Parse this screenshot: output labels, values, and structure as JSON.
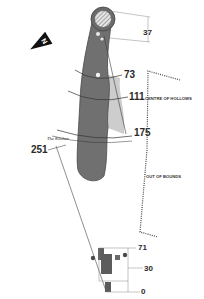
{
  "map": {
    "type": "golf-hole-layout",
    "north_indicator": {
      "label": "N"
    },
    "yardages": {
      "green_depth": "37",
      "marker_1": "73",
      "marker_2": "111",
      "marker_3": "175",
      "marker_4": "251",
      "tee_1": "71",
      "tee_2": "30",
      "tee_3": "0"
    },
    "labels": {
      "centre_of_hollows": "CENTRE OF HOLLOWS",
      "out_of_bounds": "OUT OF BOUNDS",
      "the_kitchen": "The Kitchen"
    },
    "colors": {
      "fairway": "#707070",
      "fairway_edge": "#4a4a4a",
      "rough": "#c8c8c8",
      "green_hatch": "#9a9a9a",
      "text": "#2a2a2a"
    }
  }
}
